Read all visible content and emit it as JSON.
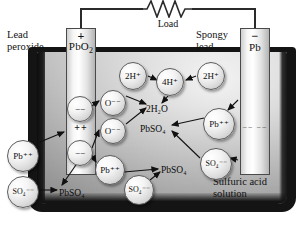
{
  "diagram": {
    "colors": {
      "case": "#141414",
      "electrolyte_light": "#f2f2f2",
      "electrolyte_dark": "#8c8c8c",
      "electrode": "#ffffff",
      "ink": "#111111"
    }
  },
  "circuit": {
    "load_label": "Load",
    "load_symbol": "resistor-zigzag"
  },
  "electrodes": {
    "left": {
      "name": "PbO₂",
      "sign": "+",
      "caption_line1": "Lead",
      "caption_line2": "peroxide",
      "plate_charges": [
        "++",
        "++"
      ]
    },
    "right": {
      "name": "Pb",
      "sign": "−",
      "caption_line1": "Spongy",
      "caption_line2": "lead",
      "plate_charges": [
        "−− −−"
      ]
    }
  },
  "electrolyte": {
    "caption_line1": "Sulfuric acid",
    "caption_line2": "solution"
  },
  "ions": [
    {
      "id": "neg-top",
      "label": "−−",
      "x": 67,
      "y": 96,
      "d": 26
    },
    {
      "id": "neg-bottom",
      "label": "−−",
      "x": 67,
      "y": 140,
      "d": 26
    },
    {
      "id": "o-top",
      "label": "O⁻⁻",
      "x": 100,
      "y": 90,
      "d": 26
    },
    {
      "id": "o-bottom",
      "label": "O⁻⁻",
      "x": 100,
      "y": 118,
      "d": 26
    },
    {
      "id": "h2-left",
      "label": "2H⁺",
      "x": 119,
      "y": 62,
      "d": 28
    },
    {
      "id": "h4-center",
      "label": "4H⁺",
      "x": 156,
      "y": 68,
      "d": 28
    },
    {
      "id": "h2-right",
      "label": "2H⁺",
      "x": 197,
      "y": 62,
      "d": 28
    },
    {
      "id": "pb-left",
      "label": "Pb⁺⁺",
      "x": 7,
      "y": 140,
      "d": 32
    },
    {
      "id": "so4-left",
      "label": "SO₄⁻⁻",
      "x": 7,
      "y": 176,
      "d": 32
    },
    {
      "id": "pb-mid",
      "label": "Pb⁺⁺",
      "x": 95,
      "y": 155,
      "d": 30
    },
    {
      "id": "pb-right",
      "label": "Pb⁺⁺",
      "x": 203,
      "y": 108,
      "d": 32
    },
    {
      "id": "so4-mid",
      "label": "SO₄⁻⁻",
      "x": 124,
      "y": 175,
      "d": 30
    },
    {
      "id": "so4-right",
      "label": "SO₄⁻⁻",
      "x": 200,
      "y": 148,
      "d": 32
    }
  ],
  "species_labels": [
    {
      "id": "water",
      "text": "2H₂O",
      "x": 146,
      "y": 104
    },
    {
      "id": "pbso4-1",
      "text": "PbSO₄",
      "x": 140,
      "y": 124
    },
    {
      "id": "pbso4-2",
      "text": "PbSO₄",
      "x": 59,
      "y": 188
    },
    {
      "id": "pbso4-3",
      "text": "PbSO₄",
      "x": 161,
      "y": 165
    }
  ]
}
